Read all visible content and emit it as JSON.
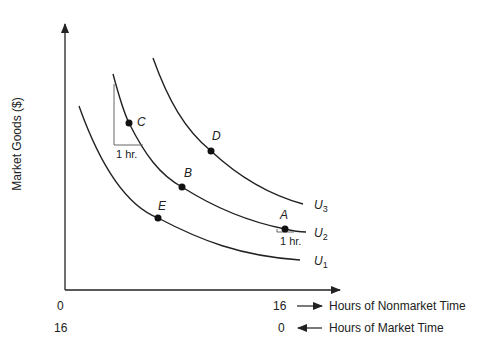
{
  "diagram": {
    "y_axis_label": "Market Goods ($)",
    "x_axis": {
      "nonmarket_start": "0",
      "nonmarket_end": "16",
      "nonmarket_label": "Hours of Nonmarket Time",
      "market_start": "16",
      "market_end": "0",
      "market_label": "Hours of Market Time"
    },
    "curves": [
      {
        "id": "U1",
        "letter": "U",
        "sub": "1"
      },
      {
        "id": "U2",
        "letter": "U",
        "sub": "2"
      },
      {
        "id": "U3",
        "letter": "U",
        "sub": "3"
      }
    ],
    "points": {
      "A": "A",
      "B": "B",
      "C": "C",
      "D": "D",
      "E": "E"
    },
    "slope_labels": {
      "at_C": "1 hr.",
      "at_A": "1 hr."
    },
    "colors": {
      "line": "#222222",
      "triangle": "#666666"
    }
  }
}
